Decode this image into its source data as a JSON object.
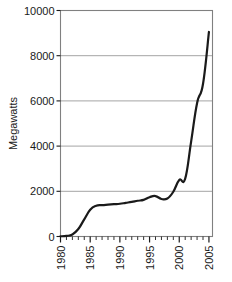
{
  "chart_data": {
    "type": "line",
    "title": "",
    "xlabel": "",
    "ylabel": "Megawatts",
    "xlim": [
      1980,
      2005.6
    ],
    "ylim": [
      0,
      10000
    ],
    "grid": true,
    "legend": null,
    "yticks": [
      0,
      2000,
      4000,
      6000,
      8000,
      10000
    ],
    "ytick_labels": [
      "0",
      "2000",
      "4000",
      "6000",
      "8000",
      "10000"
    ],
    "xticks": [
      1980,
      1985,
      1990,
      1995,
      2000,
      2005
    ],
    "xtick_labels": [
      "1980",
      "1985",
      "1990",
      "1995",
      "2000",
      "2005"
    ],
    "xtick_minor_step": 1,
    "xtick_label_rotation": 90,
    "line_color": "#1a1a1a",
    "line_width": 2.2,
    "grid_color": "#9a9a9a",
    "axes_color": "#808080",
    "background": "#ffffff",
    "x": [
      1980,
      1981,
      1982,
      1983,
      1984,
      1985,
      1986,
      1987,
      1988,
      1989,
      1990,
      1991,
      1992,
      1993,
      1994,
      1995,
      1996,
      1997,
      1998,
      1999,
      2000,
      2001,
      2002,
      2003,
      2004,
      2005
    ],
    "values": [
      10,
      25,
      90,
      330,
      760,
      1180,
      1360,
      1390,
      1410,
      1430,
      1450,
      1490,
      1530,
      1580,
      1620,
      1740,
      1790,
      1660,
      1680,
      1980,
      2500,
      2560,
      4200,
      5900,
      6750,
      9050
    ],
    "series": [
      {
        "name": "Installed capacity",
        "values": [
          10,
          25,
          90,
          330,
          760,
          1180,
          1360,
          1390,
          1410,
          1430,
          1450,
          1490,
          1530,
          1580,
          1620,
          1740,
          1790,
          1660,
          1680,
          1980,
          2500,
          2560,
          4200,
          5900,
          6750,
          9050
        ]
      }
    ]
  }
}
